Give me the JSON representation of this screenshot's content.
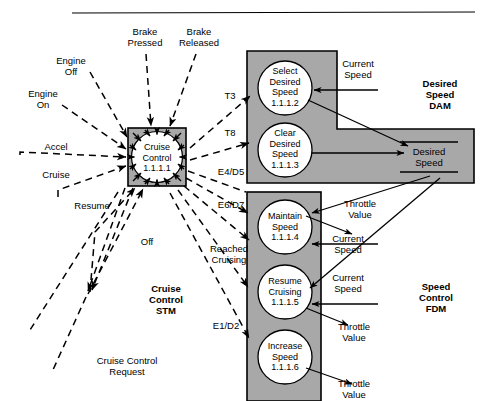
{
  "diagram": {
    "title_rule": true,
    "colors": {
      "region_fill": "#a8a8a8",
      "bubble_fill": "#ffffff",
      "stroke": "#000000",
      "background": "#ffffff"
    },
    "central_process": {
      "name": "Cruise Control",
      "id": "1.1.1",
      "label": "Cruise\nControl\n1.1.1.1"
    },
    "regions": [
      {
        "key": "dam",
        "label": "Desired\nSpeed\nDAM",
        "shape": "L-shaped"
      },
      {
        "key": "fdm",
        "label": "Speed\nControl\nFDM",
        "shape": "vertical-rect"
      },
      {
        "key": "stm",
        "label": "Cruise\nControl\nSTM",
        "shape": "none"
      }
    ],
    "processes": [
      {
        "key": "select-desired-speed",
        "label": "Select\nDesired\nSpeed\n1.1.1.2",
        "region": "dam"
      },
      {
        "key": "clear-desired-speed",
        "label": "Clear\nDesired\nSpeed\n1.1.1.3",
        "region": "dam"
      },
      {
        "key": "maintain-speed",
        "label": "Maintain\nSpeed\n1.1.1.4",
        "region": "fdm"
      },
      {
        "key": "resume-cruising",
        "label": "Resume\nCruising\n1.1.1.5",
        "region": "fdm"
      },
      {
        "key": "increase-speed",
        "label": "Increase\nSpeed\n1.1.1.6",
        "region": "fdm"
      }
    ],
    "data_store": {
      "key": "desired-speed-store",
      "label": "Desired\nSpeed"
    },
    "event_labels": [
      {
        "key": "brake-pressed",
        "text": "Brake\nPressed"
      },
      {
        "key": "brake-released",
        "text": "Brake\nReleased"
      },
      {
        "key": "engine-off",
        "text": "Engine\nOff"
      },
      {
        "key": "engine-on",
        "text": "Engine\nOn"
      },
      {
        "key": "accel",
        "text": "Accel"
      },
      {
        "key": "cruise",
        "text": "Cruise"
      },
      {
        "key": "resume",
        "text": "Resume"
      },
      {
        "key": "off",
        "text": "Off"
      },
      {
        "key": "cruise-control-request",
        "text": "Cruise Control\nRequest"
      }
    ],
    "transition_labels": [
      {
        "key": "t3",
        "text": "T3"
      },
      {
        "key": "t8",
        "text": "T8"
      },
      {
        "key": "e4-d5",
        "text": "E4/D5"
      },
      {
        "key": "e6-d7",
        "text": "E6/D7"
      },
      {
        "key": "reached-cruising",
        "text": "Reached\nCruising"
      },
      {
        "key": "e1-d2",
        "text": "E1/D2"
      }
    ],
    "flow_labels": [
      {
        "key": "current-speed-1",
        "text": "Current\nSpeed"
      },
      {
        "key": "current-speed-2",
        "text": "Current\nSpeed"
      },
      {
        "key": "current-speed-3",
        "text": "Current\nSpeed"
      },
      {
        "key": "throttle-value-1",
        "text": "Throttle\nValue"
      },
      {
        "key": "throttle-value-2",
        "text": "Throttle\nValue"
      },
      {
        "key": "throttle-value-3",
        "text": "Throttle\nValue"
      }
    ]
  }
}
